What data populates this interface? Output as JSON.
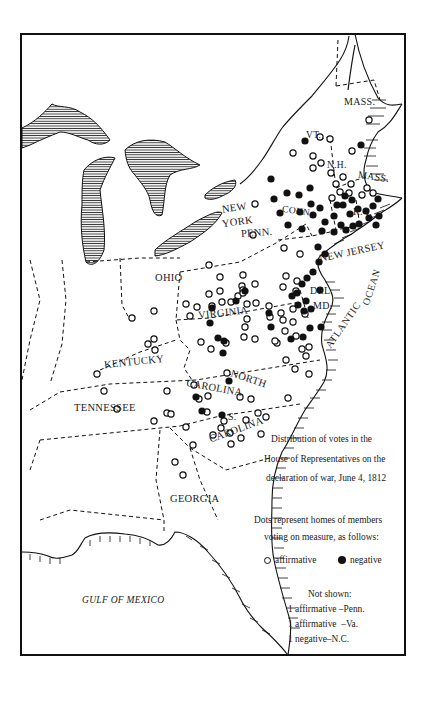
{
  "map": {
    "caption": {
      "line1": "Distribution of votes in the",
      "line2": "House of Representatives on the",
      "line3": "declaration of war, June 4, 1812"
    },
    "legend": {
      "intro_line1": "Dots represent homes of members",
      "intro_line2": "voting on measure, as follows:",
      "affirmative_label": "affirmative",
      "negative_label": "negative",
      "affirmative_icon": "open-circle",
      "negative_icon": "filled-circle"
    },
    "not_shown": {
      "title": "Not shown:",
      "items": [
        "1 affirmative –Penn.",
        "1 affirmative  –Va.",
        "1 negative–N.C."
      ]
    },
    "labels": {
      "mass_north": "MASS.",
      "vt": "VT.",
      "nh": "N.H.",
      "mass_south": "MASS.",
      "ri": "R. I.",
      "conn": "CONN.",
      "new": "NEW",
      "york": "YORK",
      "penn": "PENN.",
      "new_jersey": "NEW JERSEY",
      "ohio": "OHIO",
      "virginia": "VIRGINIA",
      "del": "DEL.",
      "md": "MD.",
      "kentucky": "KENTUCKY",
      "tennessee": "TENNESSEE",
      "north": "NORTH",
      "carolina_n": "CAROLINA",
      "s": "S.",
      "carolina_s": "CAROLINA",
      "georgia": "GEORGIA",
      "atlantic": "ATLANTIC",
      "ocean": "OCEAN",
      "gulf": "GULF OF MEXICO"
    },
    "colors": {
      "ink": "#111111",
      "paper": "#ffffff"
    }
  },
  "chart_data": {
    "type": "scatter",
    "series": [
      {
        "name": "affirmative",
        "marker": "open-circle",
        "points": [
          [
            369,
            120
          ],
          [
            352,
            151
          ],
          [
            293,
            153
          ],
          [
            313,
            156
          ],
          [
            320,
            137
          ],
          [
            330,
            139
          ],
          [
            313,
            168
          ],
          [
            321,
            163
          ],
          [
            351,
            184
          ],
          [
            331,
            173
          ],
          [
            343,
            177
          ],
          [
            332,
            198
          ],
          [
            336,
            184
          ],
          [
            349,
            193
          ],
          [
            367,
            188
          ],
          [
            373,
            193
          ],
          [
            362,
            195
          ],
          [
            340,
            192
          ],
          [
            255,
            204
          ],
          [
            253,
            235
          ],
          [
            284,
            248
          ],
          [
            300,
            254
          ],
          [
            243,
            275
          ],
          [
            209,
            265
          ],
          [
            220,
            277
          ],
          [
            242,
            286
          ],
          [
            286,
            276
          ],
          [
            297,
            281
          ],
          [
            255,
            284
          ],
          [
            283,
            287
          ],
          [
            296,
            291
          ],
          [
            209,
            294
          ],
          [
            220,
            291
          ],
          [
            231,
            302
          ],
          [
            256,
            303
          ],
          [
            269,
            306
          ],
          [
            281,
            313
          ],
          [
            283,
            320
          ],
          [
            247,
            304
          ],
          [
            238,
            296
          ],
          [
            222,
            302
          ],
          [
            186,
            304
          ],
          [
            197,
            307
          ],
          [
            212,
            306
          ],
          [
            243,
            290
          ],
          [
            243,
            293
          ],
          [
            270,
            317
          ],
          [
            293,
            322
          ],
          [
            285,
            331
          ],
          [
            296,
            336
          ],
          [
            309,
            347
          ],
          [
            277,
            343
          ],
          [
            247,
            319
          ],
          [
            245,
            327
          ],
          [
            255,
            339
          ],
          [
            244,
            337
          ],
          [
            226,
            343
          ],
          [
            201,
            342
          ],
          [
            190,
            316
          ],
          [
            211,
            349
          ],
          [
            275,
            341
          ],
          [
            302,
            349
          ],
          [
            286,
            360
          ],
          [
            295,
            369
          ],
          [
            306,
            356
          ],
          [
            309,
            374
          ],
          [
            293,
            309
          ],
          [
            305,
            314
          ],
          [
            227,
            373
          ],
          [
            194,
            385
          ],
          [
            167,
            391
          ],
          [
            208,
            396
          ],
          [
            240,
            397
          ],
          [
            251,
            399
          ],
          [
            246,
            420
          ],
          [
            224,
            421
          ],
          [
            221,
            428
          ],
          [
            258,
            413
          ],
          [
            230,
            433
          ],
          [
            261,
            434
          ],
          [
            266,
            417
          ],
          [
            241,
            438
          ],
          [
            199,
            399
          ],
          [
            167,
            413
          ],
          [
            117,
            409
          ],
          [
            154,
            421
          ],
          [
            175,
            462
          ],
          [
            183,
            475
          ],
          [
            193,
            445
          ],
          [
            231,
            444
          ],
          [
            207,
            412
          ],
          [
            288,
            398
          ],
          [
            154,
            311
          ],
          [
            132,
            318
          ],
          [
            154,
            339
          ],
          [
            148,
            344
          ],
          [
            155,
            350
          ],
          [
            97,
            374
          ],
          [
            104,
            391
          ],
          [
            186,
            427
          ],
          [
            213,
            435
          ],
          [
            171,
            414
          ]
        ]
      },
      {
        "name": "negative",
        "marker": "filled-circle",
        "points": [
          [
            361,
            145
          ],
          [
            305,
            141
          ],
          [
            271,
            179
          ],
          [
            274,
            199
          ],
          [
            287,
            193
          ],
          [
            299,
            195
          ],
          [
            310,
            188
          ],
          [
            300,
            212
          ],
          [
            311,
            204
          ],
          [
            320,
            208
          ],
          [
            280,
            213
          ],
          [
            288,
            225
          ],
          [
            302,
            229
          ],
          [
            313,
            215
          ],
          [
            325,
            222
          ],
          [
            334,
            216
          ],
          [
            337,
            205
          ],
          [
            345,
            196
          ],
          [
            343,
            205
          ],
          [
            352,
            200
          ],
          [
            358,
            209
          ],
          [
            350,
            214
          ],
          [
            322,
            231
          ],
          [
            334,
            232
          ],
          [
            341,
            225
          ],
          [
            346,
            230
          ],
          [
            353,
            226
          ],
          [
            359,
            224
          ],
          [
            369,
            218
          ],
          [
            376,
            225
          ],
          [
            379,
            216
          ],
          [
            373,
            206
          ],
          [
            366,
            211
          ],
          [
            378,
            199
          ],
          [
            318,
            247
          ],
          [
            325,
            254
          ],
          [
            319,
            262
          ],
          [
            313,
            272
          ],
          [
            307,
            278
          ],
          [
            302,
            284
          ],
          [
            297,
            293
          ],
          [
            298,
            305
          ],
          [
            306,
            301
          ],
          [
            320,
            290
          ],
          [
            311,
            309
          ],
          [
            292,
            296
          ],
          [
            245,
            291
          ],
          [
            236,
            301
          ],
          [
            212,
            308
          ],
          [
            210,
            323
          ],
          [
            269,
            313
          ],
          [
            218,
            338
          ],
          [
            224,
            341
          ],
          [
            271,
            327
          ],
          [
            291,
            339
          ],
          [
            304,
            311
          ],
          [
            321,
            327
          ],
          [
            310,
            328
          ],
          [
            303,
            337
          ],
          [
            223,
            353
          ],
          [
            229,
            381
          ],
          [
            196,
            397
          ],
          [
            202,
            411
          ],
          [
            222,
            415
          ]
        ]
      }
    ],
    "legend": [
      "affirmative",
      "negative"
    ],
    "notes": [
      "Not shown: 1 affirmative –Penn.",
      "1 affirmative –Va.",
      "1 negative–N.C."
    ]
  }
}
